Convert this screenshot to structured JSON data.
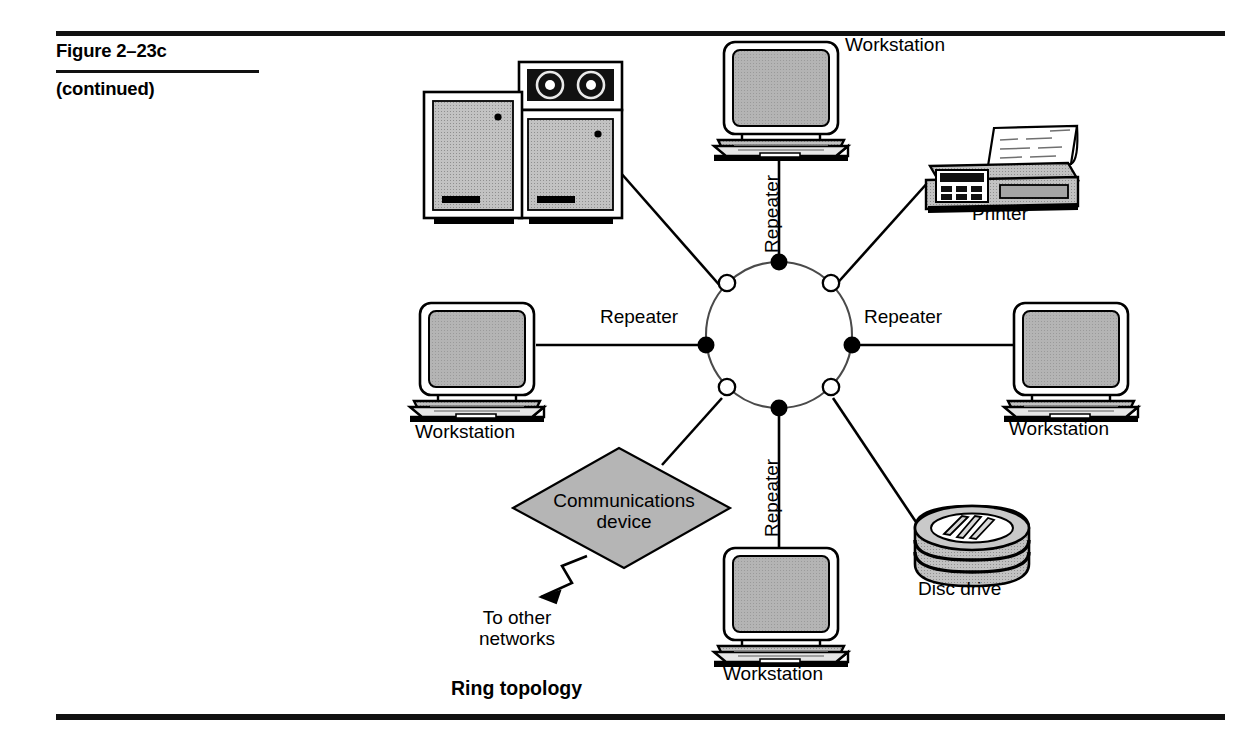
{
  "figure": {
    "title": "Figure 2–23c",
    "subtitle": "(continued)"
  },
  "diagram": {
    "caption": "Ring topology",
    "topology": "ring",
    "ring": {
      "center": [
        779,
        335
      ],
      "radius": 73,
      "repeater_nodes": 4,
      "junction_nodes": 4
    },
    "link_labels": {
      "repeater_top": "Repeater",
      "repeater_left": "Repeater",
      "repeater_right": "Repeater",
      "repeater_bottom": "Repeater"
    },
    "nodes": [
      {
        "id": "workstation-top",
        "label": "Workstation",
        "icon": "workstation-icon"
      },
      {
        "id": "printer",
        "label": "Printer",
        "icon": "printer-icon"
      },
      {
        "id": "workstation-right",
        "label": "Workstation",
        "icon": "workstation-icon"
      },
      {
        "id": "disc-drive",
        "label": "Disc drive",
        "icon": "disc-drive-icon"
      },
      {
        "id": "workstation-bottom",
        "label": "Workstation",
        "icon": "workstation-icon"
      },
      {
        "id": "communications-device",
        "label": "Communications\ndevice",
        "icon": "diamond-shape"
      },
      {
        "id": "workstation-left",
        "label": "Workstation",
        "icon": "workstation-icon"
      },
      {
        "id": "mainframe",
        "label": "",
        "icon": "mainframe-icon"
      }
    ],
    "external": {
      "label": "To other\nnetworks",
      "connector": "lightning-bolt-arrow"
    }
  },
  "colors": {
    "ink": "#000000",
    "paper": "#ffffff",
    "device_fill": "#b8b8b8",
    "screen_fill": "#b0b0b0",
    "diamond_fill": "#b5b5b5",
    "ring_stroke": "#4a4a4a"
  }
}
